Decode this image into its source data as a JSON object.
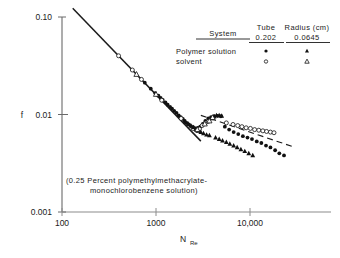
{
  "chart_data": {
    "type": "scatter",
    "title": "",
    "xlabel": "N_Re",
    "xlabel_main": "N",
    "xlabel_sub": "Re",
    "ylabel": "f",
    "xscale": "log",
    "yscale": "log",
    "xlim": [
      100,
      30000
    ],
    "ylim": [
      0.001,
      0.1
    ],
    "grid": false,
    "xticks": [
      100,
      1000,
      10000
    ],
    "xtick_labels": [
      "100",
      "1000",
      "10,000"
    ],
    "yticks": [
      0.001,
      0.01,
      0.1
    ],
    "ytick_labels": [
      "0.001",
      "0.01",
      "0.10"
    ],
    "annotation_line1": "(0.25 Percent   polymethylmethacrylate-",
    "annotation_line2": "monochlorobenzene   solution)",
    "laminar_line": {
      "label": "f = 16/N_Re",
      "x": [
        130,
        3000
      ],
      "y": [
        0.1231,
        0.00533
      ],
      "style": "solid"
    },
    "turbulent_line": {
      "label": "turbulent reference",
      "x": [
        3000,
        30000
      ],
      "y": [
        0.0098,
        0.0046
      ],
      "style": "dashed"
    },
    "series": [
      {
        "name": "Polymer solution, tube radius 0.202 cm",
        "marker": "filled-circle",
        "tube_radius_cm": 0.202,
        "points": [
          [
            760,
            0.0212
          ],
          [
            880,
            0.0184
          ],
          [
            980,
            0.0166
          ],
          [
            1060,
            0.0156
          ],
          [
            1120,
            0.0148
          ],
          [
            1180,
            0.0141
          ],
          [
            1260,
            0.0133
          ],
          [
            1330,
            0.0126
          ],
          [
            1410,
            0.012
          ],
          [
            1480,
            0.0115
          ],
          [
            1560,
            0.0109
          ],
          [
            1650,
            0.0104
          ],
          [
            1740,
            0.0098
          ],
          [
            1830,
            0.0094
          ],
          [
            1930,
            0.009
          ],
          [
            2020,
            0.0086
          ],
          [
            2120,
            0.0082
          ],
          [
            2230,
            0.0079
          ],
          [
            2350,
            0.0076
          ],
          [
            2480,
            0.0074
          ],
          [
            2620,
            0.0072
          ],
          [
            2780,
            0.0073
          ],
          [
            2950,
            0.0075
          ],
          [
            3150,
            0.008
          ],
          [
            3350,
            0.0086
          ],
          [
            3600,
            0.0091
          ],
          [
            3850,
            0.0094
          ],
          [
            4150,
            0.0096
          ],
          [
            4500,
            0.0097
          ],
          [
            4900,
            0.0096
          ],
          [
            5400,
            0.0075
          ],
          [
            6000,
            0.007
          ],
          [
            6700,
            0.0066
          ],
          [
            7500,
            0.0063
          ],
          [
            8400,
            0.006
          ],
          [
            9400,
            0.0058
          ],
          [
            10500,
            0.0056
          ],
          [
            11800,
            0.0053
          ],
          [
            13200,
            0.0051
          ],
          [
            14800,
            0.0048
          ],
          [
            16500,
            0.0046
          ],
          [
            18500,
            0.0043
          ],
          [
            20500,
            0.004
          ],
          [
            23000,
            0.0038
          ]
        ]
      },
      {
        "name": "Solvent, tube radius 0.202 cm",
        "marker": "open-circle",
        "tube_radius_cm": 0.202,
        "points": [
          [
            400,
            0.04
          ],
          [
            560,
            0.0286
          ],
          [
            700,
            0.0229
          ],
          [
            1150,
            0.014
          ],
          [
            1850,
            0.0091
          ],
          [
            2480,
            0.0072
          ],
          [
            2700,
            0.0069
          ],
          [
            2900,
            0.0071
          ],
          [
            3100,
            0.0077
          ],
          [
            3350,
            0.0082
          ],
          [
            3600,
            0.0085
          ],
          [
            5600,
            0.0082
          ],
          [
            6600,
            0.0079
          ],
          [
            7400,
            0.0077
          ],
          [
            8200,
            0.0075
          ],
          [
            9100,
            0.0073
          ],
          [
            10100,
            0.0072
          ],
          [
            11200,
            0.007
          ],
          [
            12400,
            0.0069
          ],
          [
            13700,
            0.0068
          ],
          [
            15000,
            0.0067
          ],
          [
            16500,
            0.0066
          ],
          [
            18000,
            0.0065
          ]
        ]
      },
      {
        "name": "Polymer solution, tube radius 0.0645 cm",
        "marker": "filled-triangle",
        "tube_radius_cm": 0.0645,
        "points": [
          [
            2050,
            0.0084
          ],
          [
            2200,
            0.008
          ],
          [
            2350,
            0.0077
          ],
          [
            2500,
            0.0074
          ],
          [
            2650,
            0.0071
          ],
          [
            2820,
            0.0068
          ],
          [
            3000,
            0.0066
          ],
          [
            3200,
            0.0064
          ],
          [
            3450,
            0.0062
          ],
          [
            3700,
            0.0061
          ],
          [
            3900,
            0.0091
          ],
          [
            4150,
            0.0095
          ],
          [
            4400,
            0.0098
          ],
          [
            4700,
            0.0098
          ],
          [
            5000,
            0.0097
          ],
          [
            4300,
            0.0058
          ],
          [
            4700,
            0.0056
          ],
          [
            5100,
            0.0054
          ],
          [
            5600,
            0.0052
          ],
          [
            6100,
            0.005
          ],
          [
            6700,
            0.0048
          ],
          [
            7300,
            0.0046
          ],
          [
            8000,
            0.0044
          ],
          [
            8800,
            0.0042
          ],
          [
            9700,
            0.004
          ],
          [
            10700,
            0.0038
          ]
        ]
      },
      {
        "name": "Solvent, tube radius 0.0645 cm",
        "marker": "open-triangle",
        "tube_radius_cm": 0.0645,
        "points": [
          [
            620,
            0.0258
          ],
          [
            1000,
            0.0161
          ],
          [
            2750,
            0.007
          ],
          [
            3300,
            0.008
          ],
          [
            3700,
            0.0086
          ],
          [
            4000,
            0.0093
          ]
        ]
      }
    ]
  },
  "legend": {
    "col_system": "System",
    "col_tube": "Tube",
    "col_radius": "Radius (cm)",
    "value_tube": "0.202",
    "value_radius": "0.0645",
    "rows": [
      {
        "label": "Polymer   solution",
        "tube_marker": "filled-circle",
        "radius_marker": "filled-triangle"
      },
      {
        "label": "solvent",
        "tube_marker": "open-circle",
        "radius_marker": "open-triangle"
      }
    ]
  }
}
